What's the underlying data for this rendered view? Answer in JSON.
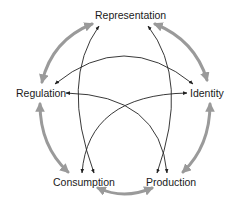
{
  "diagram": {
    "type": "cycle",
    "nodes": [
      {
        "id": "representation",
        "label": "Representation"
      },
      {
        "id": "identity",
        "label": "Identity"
      },
      {
        "id": "production",
        "label": "Production"
      },
      {
        "id": "consumption",
        "label": "Consumption"
      },
      {
        "id": "regulation",
        "label": "Regulation"
      }
    ],
    "outer_links": [
      {
        "from": "representation",
        "to": "identity",
        "style": "thick-gray",
        "bidirectional": true
      },
      {
        "from": "identity",
        "to": "production",
        "style": "thick-gray",
        "bidirectional": true
      },
      {
        "from": "production",
        "to": "consumption",
        "style": "thick-gray",
        "bidirectional": true
      },
      {
        "from": "consumption",
        "to": "regulation",
        "style": "thick-gray",
        "bidirectional": true
      },
      {
        "from": "regulation",
        "to": "representation",
        "style": "thick-gray",
        "bidirectional": true
      }
    ],
    "inner_links": [
      {
        "from": "representation",
        "to": "consumption",
        "style": "thin-black",
        "bidirectional": true
      },
      {
        "from": "representation",
        "to": "production",
        "style": "thin-black",
        "bidirectional": true
      },
      {
        "from": "regulation",
        "to": "identity",
        "style": "thin-black",
        "bidirectional": true
      },
      {
        "from": "regulation",
        "to": "production",
        "style": "thin-black",
        "bidirectional": true
      },
      {
        "from": "identity",
        "to": "consumption",
        "style": "thin-black",
        "bidirectional": true
      }
    ],
    "colors": {
      "outer_arrow": "#9a9a9a",
      "inner_arrow": "#222222",
      "text": "#1a1a1a",
      "background": "#ffffff"
    }
  }
}
